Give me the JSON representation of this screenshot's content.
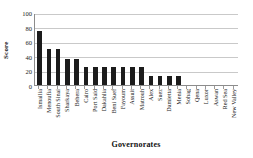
{
  "chart_data": {
    "type": "bar",
    "title": "",
    "xlabel": "Governorates",
    "ylabel": "Score",
    "ylim": [
      0,
      100
    ],
    "yticks": [
      0,
      20,
      40,
      60,
      80,
      100
    ],
    "grid": true,
    "legend": false,
    "bar_color": "#1c1c1c",
    "categories": [
      "Ismailia",
      "Menoufia",
      "South Sinai",
      "Sharkaya",
      "Behera",
      "Cairo",
      "Port Said",
      "Dakahlia",
      "Beni Suef",
      "Fayoum",
      "Assuit",
      "Matrouh",
      "Alex",
      "Suez",
      "Damietta",
      "Menia",
      "Sohag",
      "Qena",
      "Luxor",
      "Aswan",
      "Red Sea",
      "New Valley"
    ],
    "values": [
      75,
      50,
      50,
      37,
      37,
      25,
      25,
      25,
      25,
      25,
      25,
      25,
      12,
      12,
      12,
      12,
      0,
      0,
      0,
      0,
      0,
      0
    ]
  }
}
